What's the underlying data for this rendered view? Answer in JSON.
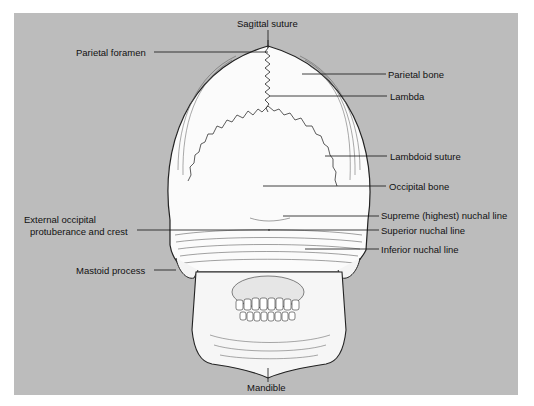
{
  "figure": {
    "background_color": "#bcbcbc",
    "labels": {
      "sagittal_suture": "Sagittal suture",
      "parietal_foramen": "Parietal foramen",
      "parietal_bone": "Parietal bone",
      "lambda": "Lambda",
      "lambdoid_suture": "Lambdoid suture",
      "occipital_bone": "Occipital bone",
      "external_occipital_line1": "External occipital",
      "external_occipital_line2": "protuberance and crest",
      "supreme_nuchal_line": "Supreme (highest) nuchal line",
      "superior_nuchal_line": "Superior nuchal line",
      "inferior_nuchal_line": "Inferior nuchal line",
      "mastoid_process": "Mastoid process",
      "mandible": "Mandible"
    }
  }
}
